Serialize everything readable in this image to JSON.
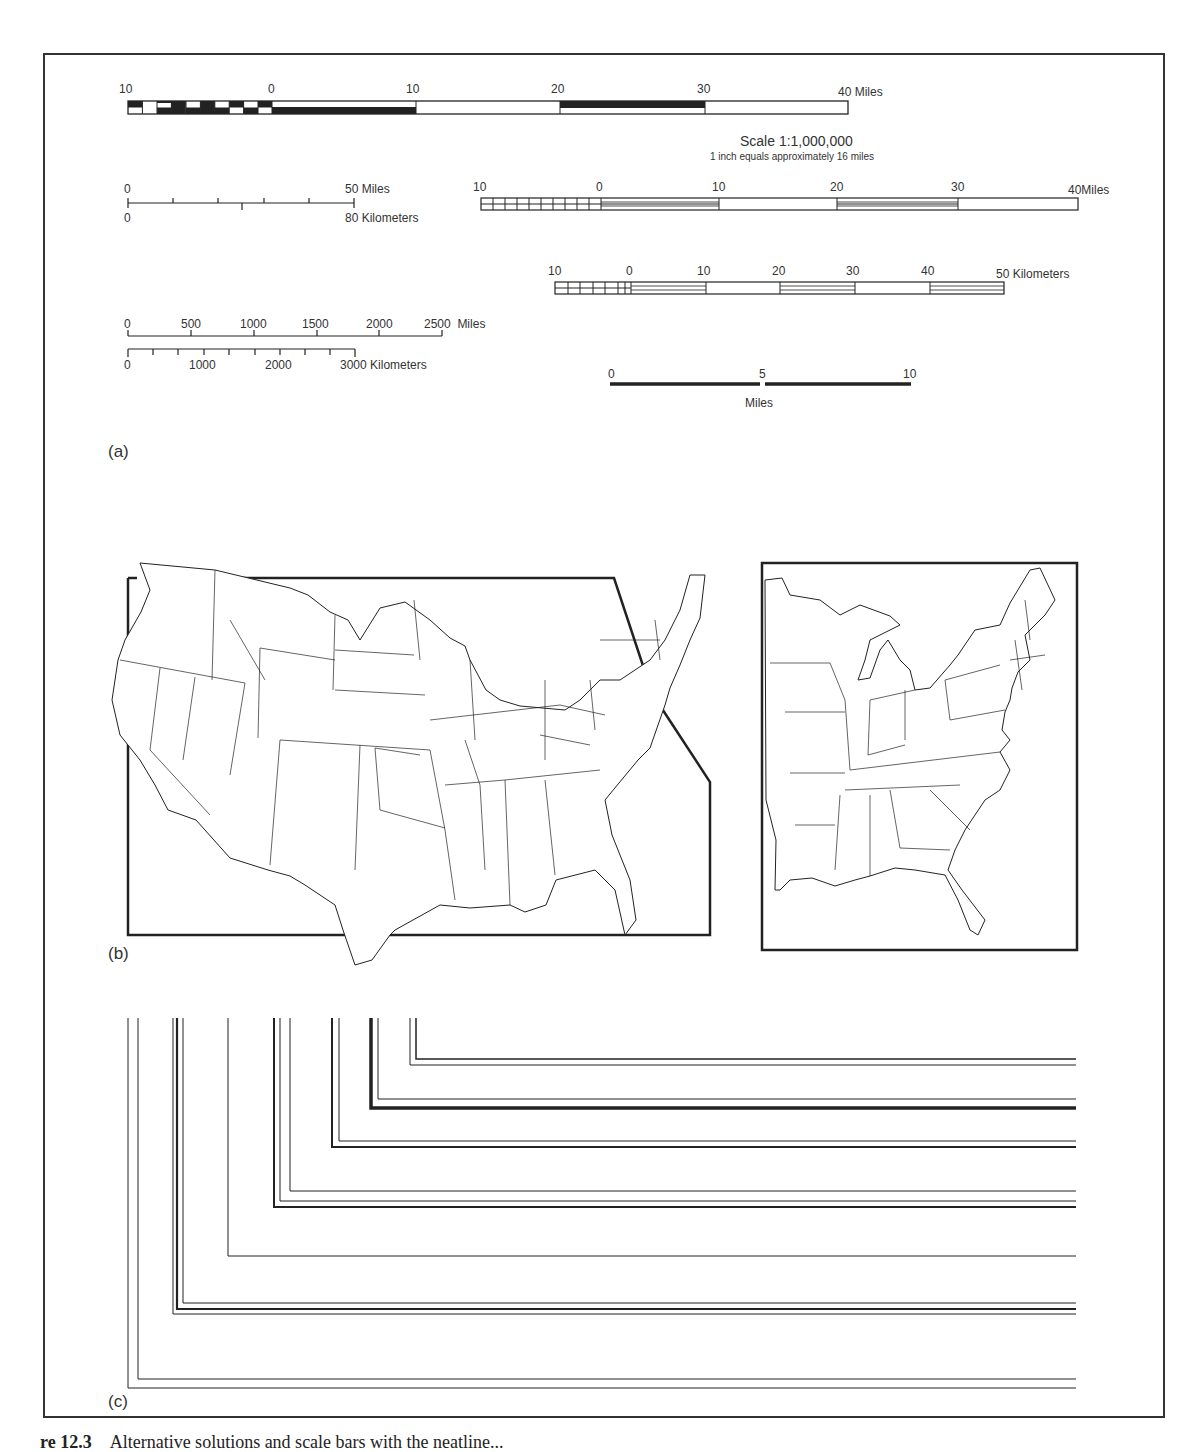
{
  "figure": {
    "panels": [
      {
        "id": "a",
        "label": "(a)"
      },
      {
        "id": "b",
        "label": "(b)"
      },
      {
        "id": "c",
        "label": "(c)"
      }
    ],
    "caption": {
      "number": "re 12.3",
      "text": "Alternative solutions and scale bars with the neatline..."
    }
  },
  "scale_bars": {
    "bar1": {
      "ticks": [
        "10",
        "0",
        "10",
        "20",
        "30",
        "40"
      ],
      "unit": "Miles",
      "scale_text": "Scale 1:1,000,000",
      "scale_note": "1 inch equals approximately 16 miles"
    },
    "bar2": {
      "top_ticks": [
        "0",
        "50"
      ],
      "top_unit": "Miles",
      "bottom_ticks": [
        "0",
        "80"
      ],
      "bottom_unit": "Kilometers"
    },
    "bar3": {
      "ticks": [
        "10",
        "0",
        "10",
        "20",
        "30",
        "40"
      ],
      "unit": "Miles"
    },
    "bar4": {
      "ticks": [
        "10",
        "0",
        "10",
        "20",
        "30",
        "40",
        "50"
      ],
      "unit": "Kilometers"
    },
    "bar5": {
      "top_ticks": [
        "0",
        "500",
        "1000",
        "1500",
        "2000",
        "2500"
      ],
      "top_unit": "Miles",
      "bottom_ticks": [
        "0",
        "1000",
        "2000",
        "3000"
      ],
      "bottom_unit": "Kilometers"
    },
    "bar6": {
      "ticks": [
        "0",
        "5",
        "10"
      ],
      "unit": "Miles"
    }
  },
  "maps": {
    "left": {
      "description": "Conterminous United States within an irregular neatline"
    },
    "right": {
      "description": "Eastern United States within a rectangular neatline"
    }
  },
  "neatlines": {
    "sets": [
      {
        "name": "double-thin-outer",
        "count": 2
      },
      {
        "name": "triple-mixed",
        "count": 3
      },
      {
        "name": "single-thin",
        "count": 1
      },
      {
        "name": "triple-thin-thick",
        "count": 3
      },
      {
        "name": "double-thin-thick",
        "count": 2
      },
      {
        "name": "double-thick-thin",
        "count": 2
      },
      {
        "name": "double-thin-inner",
        "count": 2
      }
    ]
  },
  "colors": {
    "ink": "#222222",
    "paper": "#ffffff"
  }
}
